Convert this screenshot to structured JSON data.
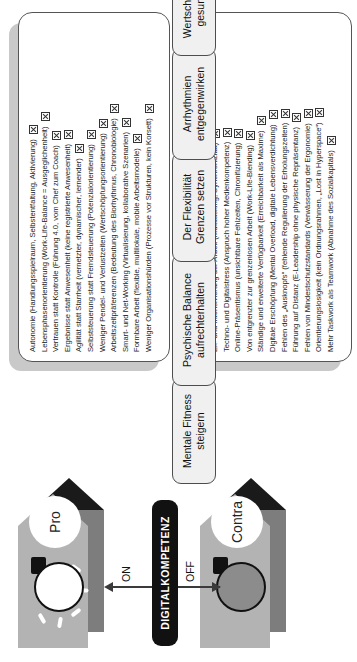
{
  "title": "DIGITALKOMPETENZ",
  "switch": {
    "label": "DIGITALKOMPETENZ",
    "on_label": "ON",
    "off_label": "OFF"
  },
  "colors": {
    "banner": "#b3b3b3",
    "banner_shadow": "#7d7d7d",
    "banner_tip_shadow": "#1a1a1a",
    "card_border": "#555555",
    "pill_fill": "#f0f0f0",
    "switch_fill": "#111111",
    "bulb_on": "#ffffff",
    "bulb_off": "#8c8c8c"
  },
  "pro": {
    "circle_label": "Pro",
    "headers": [
      "Mentale Fitness steigern",
      "Psychische Balance aufrechterhalten",
      "Der Flexibilität Grenzen setzen",
      "Arrhythmien entgegenwirken",
      "Wertschätzend und gesund führen"
    ],
    "header_lines": [
      [
        "Mentale Fitness",
        "steigern"
      ],
      [
        "Psychische Balance",
        "aufrechterhalten"
      ],
      [
        "Der Flexibilität",
        "Grenzen setzen"
      ],
      [
        "Arrhythmien",
        "entgegenwirken"
      ],
      [
        "Wertschätzend und",
        "gesund führen"
      ]
    ],
    "items": [
      "Autonomie (Handlungsspielraum, Selbstentfaltung, Aktivierung)",
      "Lebensphasenorientierung (Work-Life-Balance = Ausgeglichenheit)",
      "Vertrauen statt Kontrolle (Führung 4.0, vom Chef zum Coach)",
      "Ergebnisse statt Anwesenheit (keine registrierte Anwesenheit)",
      "Agilität statt Starrheit (vernetzter, dynamischer, lernender)",
      "Selbststeuerung statt Fremdsteuerung (Potenzialorientierung)",
      "Weniger Pendel- und Verlustzeiten (Wertschöpfungsorientierung)",
      "Arbeitszeitpräferenzen (Bedeutung des Biorhythmus, Chronobiologie)",
      "Smart- und Net-Working (Virtualisierung, kollaborative Szenarien)",
      "Formbare Arbeit (flexible, multilokale, mobile Arbeitsmodelle)",
      "Weniger Organisationshürden (Prozesse vor Strukturen, kein Korsett)"
    ]
  },
  "contra": {
    "circle_label": "Contra",
    "items": [
      "Ex- und Intensivierung der Arbeit (Multitasking, Synchronizität)",
      "Techno- und Digitalstress (Anspruch hoher Medienkompetenz)",
      "Online-Präsentismus (unsichtbare Fehlzeiten, Chronifizierung)",
      "Von entgrenzter zur grenzenlosen Arbeit (Work-Life-Blending)",
      "Ständige und erweiterte Verfügbarkeit (Erreichbarkeit als Maxime)",
      "Digitale Erschöpfung (Mental Overload, digitale Lebensverdichtung)",
      "Fehlen des „Ausknopfs“ (fehlende Regulierung der Erholungszeiten)",
      "Führung auf Distanz (E-Leadership ohne physische Repräsentanz)",
      "Fehlen von Mindestschutzstandards (Verwässerung der Ergonomie)",
      "Orientierungslosigkeit (kein Ordnungsrahmen, „Lost in Hyperspace“)",
      "Mehr Taskwork als Teamwork (Abnahme des Sozialkapitals)"
    ]
  }
}
